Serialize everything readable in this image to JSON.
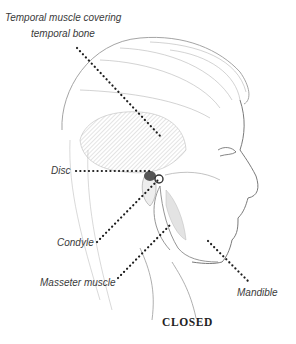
{
  "diagram": {
    "type": "anatomical-illustration",
    "caption": "CLOSED",
    "labels": {
      "temporal_line1": "Temporal muscle covering",
      "temporal_line2": "temporal bone",
      "disc": "Disc",
      "condyle": "Condyle",
      "masseter": "Masseter muscle",
      "mandible": "Mandible"
    },
    "colors": {
      "ink": "#2a2a2a",
      "sketch": "#9a9a9a",
      "shade": "#c8c8c8",
      "label_text": "#3a3a3a"
    }
  }
}
